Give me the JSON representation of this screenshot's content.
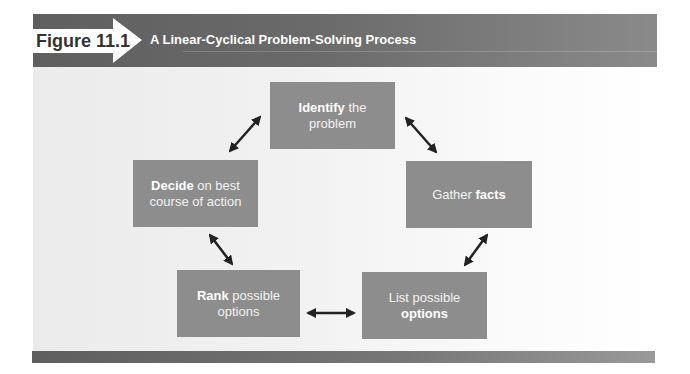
{
  "figure": {
    "label": "Figure 11.1",
    "title": "A Linear-Cyclical Problem-Solving Process"
  },
  "colors": {
    "header_bar": "#666666",
    "box_fill": "#8d8d8d",
    "box_text": "#ffffff",
    "arrow": "#222222",
    "panel": "#efefef"
  },
  "steps": [
    {
      "id": "identify",
      "bold": "Identify",
      "pre": "",
      "post": " the problem"
    },
    {
      "id": "gather",
      "bold": "facts",
      "pre": "Gather ",
      "post": ""
    },
    {
      "id": "list",
      "bold": "options",
      "pre": "List possible ",
      "post": ""
    },
    {
      "id": "rank",
      "bold": "Rank",
      "pre": "",
      "post": " possible options"
    },
    {
      "id": "decide",
      "bold": "Decide",
      "pre": "",
      "post": " on best course of action"
    }
  ],
  "connections": [
    {
      "from": "identify",
      "to": "gather",
      "type": "bidirectional"
    },
    {
      "from": "gather",
      "to": "list",
      "type": "bidirectional"
    },
    {
      "from": "list",
      "to": "rank",
      "type": "bidirectional"
    },
    {
      "from": "rank",
      "to": "decide",
      "type": "bidirectional"
    },
    {
      "from": "decide",
      "to": "identify",
      "type": "bidirectional"
    }
  ]
}
